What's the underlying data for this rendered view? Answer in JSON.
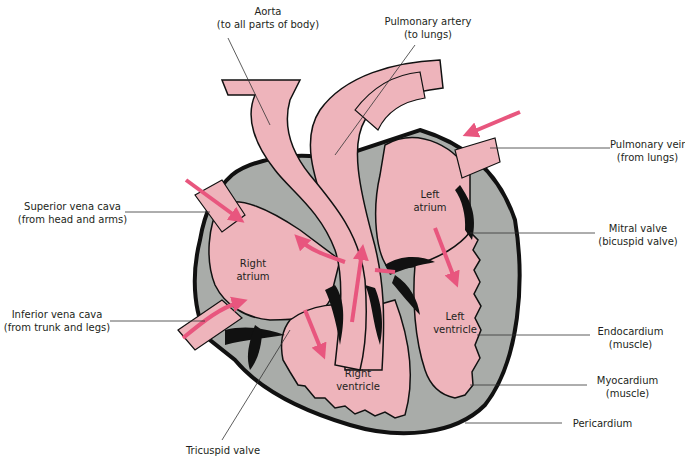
{
  "diagram": {
    "colors": {
      "chamber_fill": "#eeb4bb",
      "muscle_fill": "#a9aca9",
      "outline": "#111111",
      "arrow": "#e8567e",
      "leader_line": "#333333",
      "text": "#231f20"
    },
    "labels": {
      "aorta": {
        "line1": "Aorta",
        "line2": "(to all parts of body)"
      },
      "pulmonary_artery": {
        "line1": "Pulmonary artery",
        "line2": "(to lungs)"
      },
      "pulmonary_vein": {
        "line1": "Pulmonary vein",
        "line2": "(from lungs)"
      },
      "superior_vena_cava": {
        "line1": "Superior vena cava",
        "line2": "(from head and arms)"
      },
      "inferior_vena_cava": {
        "line1": "Inferior vena cava",
        "line2": "(from trunk and legs)"
      },
      "mitral_valve": {
        "line1": "Mitral valve",
        "line2": "(bicuspid valve)"
      },
      "endocardium": {
        "line1": "Endocardium",
        "line2": "(muscle)"
      },
      "myocardium": {
        "line1": "Myocardium",
        "line2": "(muscle)"
      },
      "pericardium": {
        "line1": "Pericardium"
      },
      "tricuspid_valve": {
        "line1": "Tricuspid valve"
      }
    },
    "chambers": {
      "right_atrium": {
        "line1": "Right",
        "line2": "atrium"
      },
      "left_atrium": {
        "line1": "Left",
        "line2": "atrium"
      },
      "right_ventricle": {
        "line1": "Right",
        "line2": "ventricle"
      },
      "left_ventricle": {
        "line1": "Left",
        "line2": "ventricle"
      }
    }
  }
}
